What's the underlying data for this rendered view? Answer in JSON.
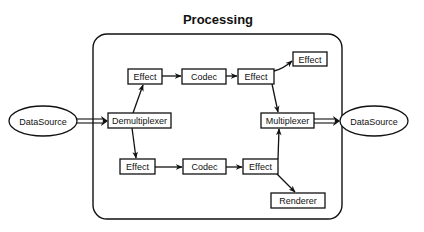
{
  "diagram": {
    "title": "Processing",
    "container": {
      "label": "Processing",
      "x": 93,
      "y": 34,
      "w": 249,
      "h": 185,
      "r": 14
    },
    "nodes": [
      {
        "id": "ds_in",
        "label": "DataSource",
        "shape": "ellipse"
      },
      {
        "id": "demux",
        "label": "Demultiplexer",
        "shape": "rect"
      },
      {
        "id": "eff_t1",
        "label": "Effect",
        "shape": "rect"
      },
      {
        "id": "codec_t",
        "label": "Codec",
        "shape": "rect"
      },
      {
        "id": "eff_t2",
        "label": "Effect",
        "shape": "rect"
      },
      {
        "id": "eff_t3",
        "label": "Effect",
        "shape": "rect"
      },
      {
        "id": "eff_b1",
        "label": "Effect",
        "shape": "rect"
      },
      {
        "id": "codec_b",
        "label": "Codec",
        "shape": "rect"
      },
      {
        "id": "eff_b2",
        "label": "Effect",
        "shape": "rect"
      },
      {
        "id": "renderer",
        "label": "Renderer",
        "shape": "rect"
      },
      {
        "id": "mux",
        "label": "Multiplexer",
        "shape": "rect"
      },
      {
        "id": "ds_out",
        "label": "DataSource",
        "shape": "ellipse"
      }
    ],
    "edges": [
      {
        "from": "ds_in",
        "to": "demux",
        "style": "double"
      },
      {
        "from": "demux",
        "to": "eff_t1"
      },
      {
        "from": "demux",
        "to": "eff_b1"
      },
      {
        "from": "eff_t1",
        "to": "codec_t"
      },
      {
        "from": "codec_t",
        "to": "eff_t2"
      },
      {
        "from": "eff_t2",
        "to": "eff_t3"
      },
      {
        "from": "eff_t2",
        "to": "mux"
      },
      {
        "from": "eff_b1",
        "to": "codec_b"
      },
      {
        "from": "codec_b",
        "to": "eff_b2"
      },
      {
        "from": "eff_b2",
        "to": "mux"
      },
      {
        "from": "eff_b2",
        "to": "renderer"
      },
      {
        "from": "mux",
        "to": "ds_out",
        "style": "double"
      }
    ]
  }
}
